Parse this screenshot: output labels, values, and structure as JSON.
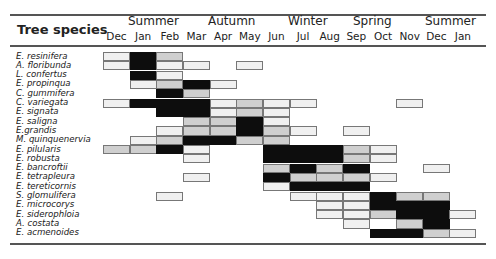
{
  "chart_data": {
    "type": "heatmap",
    "title": "",
    "row_header": "Tree species",
    "seasons": [
      {
        "label": "Summer",
        "x": 150
      },
      {
        "label": "Autumn",
        "x": 230
      },
      {
        "label": "Winter",
        "x": 310
      },
      {
        "label": "Spring",
        "x": 375
      },
      {
        "label": "Summer",
        "x": 447
      }
    ],
    "months": [
      "Dec",
      "Jan",
      "Feb",
      "Mar",
      "Apr",
      "May",
      "Jun",
      "Jul",
      "Aug",
      "Sep",
      "Oct",
      "Nov",
      "Dec",
      "Jan"
    ],
    "intensity_legend": {
      "0": "none",
      "1": "light (stippled)",
      "2": "medium (grey)",
      "3": "peak (black)"
    },
    "rows": [
      {
        "species": "E. resinifera",
        "values": [
          1,
          3,
          2,
          0,
          0,
          0,
          0,
          0,
          0,
          0,
          0,
          0,
          0,
          0
        ]
      },
      {
        "species": "A. floribunda",
        "values": [
          1,
          3,
          1,
          1,
          0,
          1,
          0,
          0,
          0,
          0,
          0,
          0,
          0,
          0
        ]
      },
      {
        "species": "L. confertus",
        "values": [
          0,
          3,
          1,
          0,
          0,
          0,
          0,
          0,
          0,
          0,
          0,
          0,
          0,
          0
        ]
      },
      {
        "species": "E. propinqua",
        "values": [
          0,
          1,
          2,
          3,
          1,
          0,
          0,
          0,
          0,
          0,
          0,
          0,
          0,
          0
        ]
      },
      {
        "species": "C. gummifera",
        "values": [
          0,
          0,
          3,
          2,
          0,
          0,
          0,
          0,
          0,
          0,
          0,
          0,
          0,
          0
        ]
      },
      {
        "species": "C. variegata",
        "values": [
          1,
          3,
          3,
          3,
          1,
          2,
          1,
          1,
          0,
          0,
          0,
          1,
          0,
          0
        ]
      },
      {
        "species": "E. signata",
        "values": [
          0,
          0,
          3,
          3,
          1,
          2,
          1,
          0,
          0,
          0,
          0,
          0,
          0,
          0
        ]
      },
      {
        "species": "E. saligna",
        "values": [
          0,
          0,
          0,
          2,
          2,
          3,
          1,
          0,
          0,
          0,
          0,
          0,
          0,
          0
        ]
      },
      {
        "species": "E.grandis",
        "values": [
          0,
          0,
          1,
          2,
          2,
          3,
          2,
          1,
          0,
          1,
          0,
          0,
          0,
          0
        ]
      },
      {
        "species": "M. quinquenervia",
        "values": [
          0,
          1,
          2,
          3,
          3,
          2,
          2,
          0,
          0,
          0,
          0,
          0,
          0,
          0
        ]
      },
      {
        "species": "E. pilularis",
        "values": [
          2,
          2,
          3,
          1,
          0,
          0,
          3,
          3,
          3,
          2,
          1,
          0,
          0,
          0
        ]
      },
      {
        "species": "E. robusta",
        "values": [
          0,
          0,
          0,
          1,
          0,
          0,
          3,
          3,
          3,
          2,
          1,
          0,
          0,
          0
        ]
      },
      {
        "species": "E. bancroftii",
        "values": [
          0,
          0,
          0,
          0,
          0,
          0,
          2,
          3,
          2,
          3,
          0,
          0,
          1,
          0
        ]
      },
      {
        "species": "E. tetrapleura",
        "values": [
          0,
          0,
          0,
          1,
          0,
          0,
          3,
          2,
          2,
          2,
          1,
          0,
          0,
          0
        ]
      },
      {
        "species": "E. tereticornis",
        "values": [
          0,
          0,
          0,
          0,
          0,
          0,
          1,
          3,
          3,
          3,
          0,
          0,
          0,
          0
        ]
      },
      {
        "species": "S. glomulifera",
        "values": [
          0,
          0,
          1,
          0,
          0,
          0,
          0,
          1,
          1,
          1,
          3,
          2,
          2,
          0
        ]
      },
      {
        "species": "E. microcorys",
        "values": [
          0,
          0,
          0,
          0,
          0,
          0,
          0,
          0,
          1,
          1,
          3,
          3,
          3,
          0
        ]
      },
      {
        "species": "E. siderophloia",
        "values": [
          0,
          0,
          0,
          0,
          0,
          0,
          0,
          0,
          1,
          1,
          2,
          3,
          3,
          1
        ]
      },
      {
        "species": "A. costata",
        "values": [
          0,
          0,
          0,
          0,
          0,
          0,
          0,
          0,
          0,
          1,
          0,
          2,
          3,
          0
        ]
      },
      {
        "species": "E. acmenoides",
        "values": [
          0,
          0,
          0,
          0,
          0,
          0,
          0,
          0,
          0,
          0,
          3,
          3,
          2,
          1
        ]
      }
    ],
    "colors": {
      "1": "#f0f0f0",
      "2": "#cfcfcf",
      "3": "#0d0d0d"
    }
  }
}
